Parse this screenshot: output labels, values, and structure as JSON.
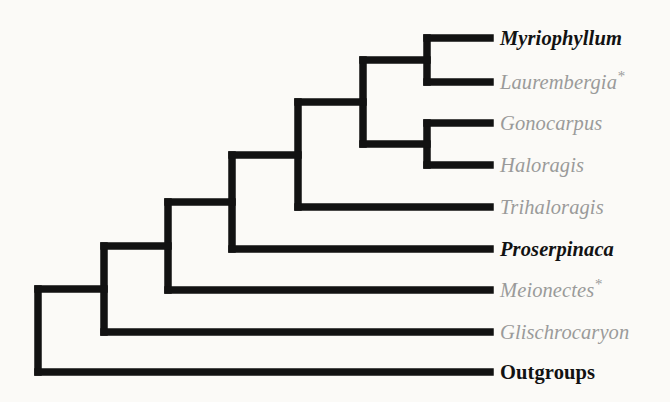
{
  "figure": {
    "kind": "phylogenetic-cladogram",
    "background_color": "#fbfaf7",
    "branch_color": "#121212",
    "branch_width_px": 7.5,
    "label_start_x": 500,
    "tip_end_x": 490
  },
  "styles": {
    "highlight_color": "#121212",
    "muted_color": "#9a9a9a"
  },
  "taxa": [
    {
      "id": "myriophyllum",
      "label": "Myriophyllum",
      "suffix": "",
      "emphasis": "bold-italic",
      "color": "#121212",
      "tip_y": 38
    },
    {
      "id": "laurembergia",
      "label": "Laurembergia",
      "suffix": "*",
      "emphasis": "italic",
      "color": "#9a9a9a",
      "tip_y": 82
    },
    {
      "id": "gonocarpus",
      "label": "Gonocarpus",
      "suffix": "",
      "emphasis": "italic",
      "color": "#9a9a9a",
      "tip_y": 123
    },
    {
      "id": "haloragis",
      "label": "Haloragis",
      "suffix": "",
      "emphasis": "italic",
      "color": "#9a9a9a",
      "tip_y": 165
    },
    {
      "id": "trihaloragis",
      "label": "Trihaloragis",
      "suffix": "",
      "emphasis": "italic",
      "color": "#9a9a9a",
      "tip_y": 207
    },
    {
      "id": "proserpinaca",
      "label": "Proserpinaca",
      "suffix": "",
      "emphasis": "bold-italic",
      "color": "#121212",
      "tip_y": 249
    },
    {
      "id": "meionectes",
      "label": "Meionectes",
      "suffix": "*",
      "emphasis": "italic",
      "color": "#9a9a9a",
      "tip_y": 290
    },
    {
      "id": "glischrocaryon",
      "label": "Glischrocaryon",
      "suffix": "",
      "emphasis": "italic",
      "color": "#9a9a9a",
      "tip_y": 332
    },
    {
      "id": "outgroups",
      "label": "Outgroups",
      "suffix": "",
      "emphasis": "bold-upright",
      "color": "#121212",
      "tip_y": 372
    }
  ],
  "nodes": [
    {
      "id": "node-myriophyllum-laurembergia",
      "x": 427,
      "y_top": 38,
      "y_bottom": 82,
      "parent_x": 363
    },
    {
      "id": "node-gonocarpus-haloragis",
      "x": 427,
      "y_top": 123,
      "y_bottom": 165,
      "parent_x": 363
    },
    {
      "id": "node-core-haloragoideae",
      "x": 363,
      "y_top": 60,
      "y_bottom": 144,
      "parent_x": 298
    },
    {
      "id": "node-plus-trihaloragis",
      "x": 298,
      "y_top": 102,
      "y_bottom": 207,
      "parent_x": 232
    },
    {
      "id": "node-plus-proserpinaca",
      "x": 232,
      "y_top": 155,
      "y_bottom": 249,
      "parent_x": 168
    },
    {
      "id": "node-plus-meionectes",
      "x": 168,
      "y_top": 202,
      "y_bottom": 290,
      "parent_x": 104
    },
    {
      "id": "node-plus-glischrocaryon",
      "x": 104,
      "y_top": 246,
      "y_bottom": 332,
      "parent_x": 38
    },
    {
      "id": "node-root",
      "x": 38,
      "y_top": 289,
      "y_bottom": 372,
      "parent_x": 38
    }
  ],
  "terminal_branches": [
    {
      "id": "branch-myriophyllum",
      "from_x": 427,
      "to_x": 490,
      "y": 38
    },
    {
      "id": "branch-laurembergia",
      "from_x": 427,
      "to_x": 490,
      "y": 82
    },
    {
      "id": "branch-gonocarpus",
      "from_x": 427,
      "to_x": 490,
      "y": 123
    },
    {
      "id": "branch-haloragis",
      "from_x": 427,
      "to_x": 490,
      "y": 165
    },
    {
      "id": "branch-trihaloragis",
      "from_x": 298,
      "to_x": 490,
      "y": 207
    },
    {
      "id": "branch-proserpinaca",
      "from_x": 232,
      "to_x": 490,
      "y": 249
    },
    {
      "id": "branch-meionectes",
      "from_x": 168,
      "to_x": 490,
      "y": 290
    },
    {
      "id": "branch-glischrocaryon",
      "from_x": 104,
      "to_x": 490,
      "y": 332
    },
    {
      "id": "branch-outgroups",
      "from_x": 38,
      "to_x": 490,
      "y": 372
    }
  ],
  "internal_branches": [
    {
      "id": "stem-myriophyllum-laurembergia",
      "from_x": 363,
      "to_x": 427,
      "y": 60
    },
    {
      "id": "stem-gonocarpus-haloragis",
      "from_x": 363,
      "to_x": 427,
      "y": 144
    },
    {
      "id": "stem-core-haloragoideae",
      "from_x": 298,
      "to_x": 363,
      "y": 102
    },
    {
      "id": "stem-plus-trihaloragis",
      "from_x": 232,
      "to_x": 298,
      "y": 155
    },
    {
      "id": "stem-plus-proserpinaca",
      "from_x": 168,
      "to_x": 232,
      "y": 202
    },
    {
      "id": "stem-plus-meionectes",
      "from_x": 104,
      "to_x": 168,
      "y": 246
    },
    {
      "id": "stem-plus-glischrocaryon",
      "from_x": 38,
      "to_x": 104,
      "y": 289
    }
  ]
}
